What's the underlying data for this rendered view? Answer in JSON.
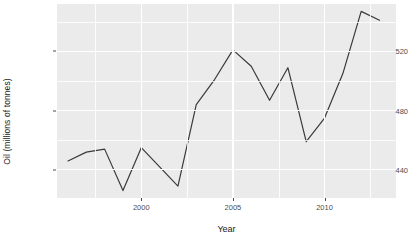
{
  "chart_data": {
    "type": "line",
    "title": "",
    "xlabel": "Year",
    "ylabel": "Oil (millions of tonnes)",
    "xlim": [
      1995.4,
      2013.9
    ],
    "ylim": [
      421,
      552
    ],
    "grid": true,
    "legend": "none",
    "x": [
      1996,
      1997,
      1998,
      1999,
      2000,
      2001,
      2002,
      2003,
      2004,
      2005,
      2006,
      2007,
      2008,
      2009,
      2010,
      2011,
      2012,
      2013
    ],
    "values": [
      446,
      452,
      454,
      426,
      455,
      442,
      429,
      484,
      501,
      521,
      510,
      487,
      509,
      459,
      475,
      505,
      547,
      541
    ],
    "series": [
      {
        "name": "Oil",
        "color": "#3a3a3a",
        "values": [
          446,
          452,
          454,
          426,
          455,
          442,
          429,
          484,
          501,
          521,
          510,
          487,
          509,
          459,
          475,
          505,
          547,
          541
        ]
      }
    ],
    "y_ticks": [
      440,
      480,
      520
    ],
    "y_tick_labels": [
      "440",
      "480",
      "520"
    ],
    "y_minor_ticks": [
      420,
      460,
      500,
      540
    ],
    "x_ticks": [
      2000,
      2005,
      2010
    ],
    "x_tick_labels": [
      "2000",
      "2005",
      "2010"
    ],
    "x_minor_ticks": [
      1997.5,
      2002.5,
      2007.5,
      2012.5
    ],
    "panel_background": "#ebebeb",
    "grid_color": "#ffffff",
    "line_color": "#3a3a3a",
    "line_width": 1.2
  }
}
